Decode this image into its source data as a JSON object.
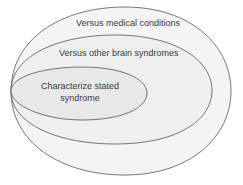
{
  "diagram": {
    "type": "nested-ellipses",
    "colors": {
      "outer_fill": "#f4f4f4",
      "middle_fill": "#efefef",
      "inner_fill": "#e8e8e8",
      "stroke": "#555555",
      "text": "#3a3a3a"
    },
    "levels": [
      {
        "id": "outer",
        "label_lines": [
          "Versus medical conditions"
        ]
      },
      {
        "id": "middle",
        "label_lines": [
          "Versus other brain syndromes"
        ]
      },
      {
        "id": "inner",
        "label_lines": [
          "Characterize stated",
          "syndrome"
        ]
      }
    ]
  }
}
